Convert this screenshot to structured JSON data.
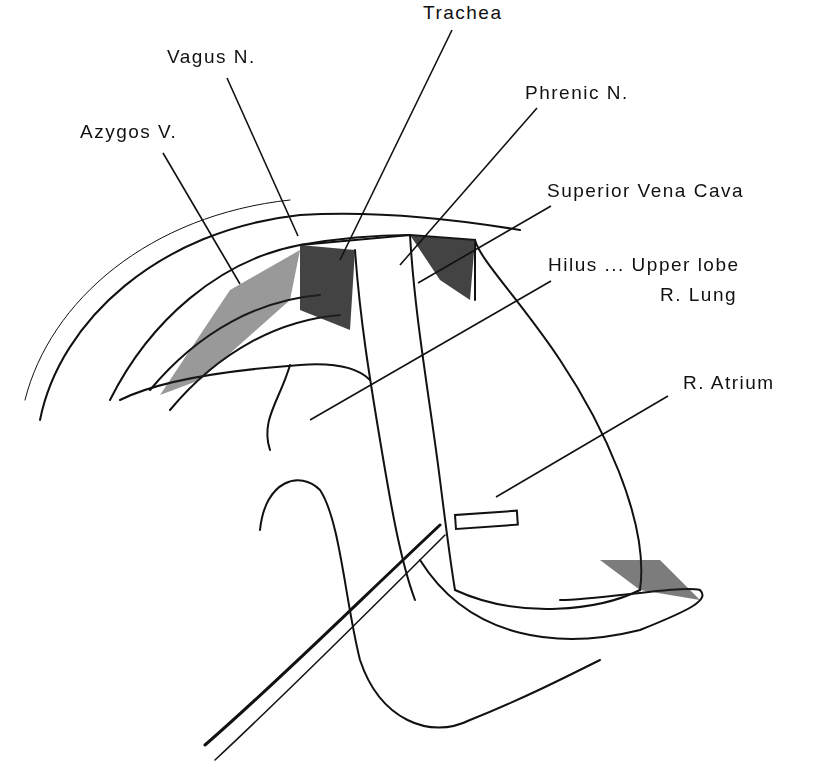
{
  "figure": {
    "type": "surgical anatomical line illustration",
    "labels": [
      {
        "id": "trachea",
        "text": "Trachea",
        "x": 423,
        "y": 2
      },
      {
        "id": "vagus",
        "text": "Vagus N.",
        "x": 167,
        "y": 46
      },
      {
        "id": "phrenic",
        "text": "Phrenic N.",
        "x": 525,
        "y": 82
      },
      {
        "id": "azygos",
        "text": "Azygos V.",
        "x": 80,
        "y": 121
      },
      {
        "id": "svc",
        "text": "Superior Vena Cava",
        "x": 547,
        "y": 180
      },
      {
        "id": "hilus",
        "text": "Hilus ... Upper lobe",
        "x": 548,
        "y": 254
      },
      {
        "id": "lung",
        "text": "R. Lung",
        "x": 660,
        "y": 284
      },
      {
        "id": "atrium",
        "text": "R. Atrium",
        "x": 683,
        "y": 372
      }
    ]
  }
}
